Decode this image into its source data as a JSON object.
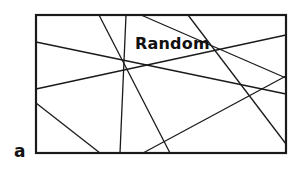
{
  "figure": {
    "title": "Random",
    "panel_label": "a",
    "frame": {
      "x": 36,
      "y": 15,
      "width": 250,
      "height": 138
    },
    "line_color": "#1a1a1a",
    "lines": [
      {
        "x1": 36,
        "y1": 42,
        "x2": 286,
        "y2": 94
      },
      {
        "x1": 36,
        "y1": 89,
        "x2": 286,
        "y2": 35
      },
      {
        "x1": 36,
        "y1": 103,
        "x2": 100,
        "y2": 153
      },
      {
        "x1": 99,
        "y1": 15,
        "x2": 170,
        "y2": 153
      },
      {
        "x1": 126,
        "y1": 15,
        "x2": 120,
        "y2": 153
      },
      {
        "x1": 188,
        "y1": 15,
        "x2": 286,
        "y2": 144
      },
      {
        "x1": 141,
        "y1": 15,
        "x2": 286,
        "y2": 78
      },
      {
        "x1": 143,
        "y1": 153,
        "x2": 286,
        "y2": 76
      }
    ]
  }
}
